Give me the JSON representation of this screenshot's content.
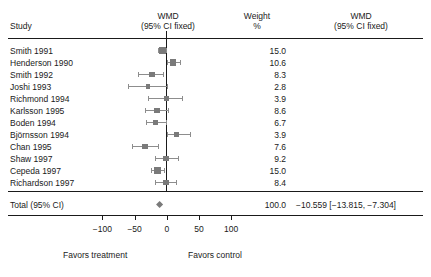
{
  "headers": {
    "study": "Study",
    "wmd_left_line1": "WMD",
    "wmd_left_line2": "(95% CI fixed)",
    "weight_line1": "Weight",
    "weight_line2": "%",
    "wmd_right_line1": "WMD",
    "wmd_right_line2": "(95% CI fixed)"
  },
  "total": {
    "label": "Total (95% CI)",
    "weight": "100.0",
    "estimate": "−10.559 [−13.815, −7.304]"
  },
  "axis": {
    "tick_labels": [
      "−100",
      "−50",
      "0",
      "50",
      "100"
    ],
    "tick_values": [
      -100,
      -50,
      0,
      50,
      100
    ],
    "favors_left": "Favors treatment",
    "favors_right": "Favors control"
  },
  "colors": {
    "ink": "#1a1a1a",
    "marker": "#7a7a7a",
    "ci": "#8d8d8d",
    "background": "#ffffff"
  },
  "chart_data": {
    "type": "forest",
    "title": "WMD (95% CI fixed)",
    "xlabel": "",
    "ylabel": "",
    "xlim": [
      -130,
      50
    ],
    "grid": false,
    "effect_measure": "WMD",
    "model": "fixed",
    "null_value": 0,
    "categories": [
      "Smith 1991",
      "Henderson 1990",
      "Smith 1992",
      "Joshi 1993",
      "Richmond 1994",
      "Karlsson 1995",
      "Boden 1994",
      "Björnsson 1994",
      "Chan 1995",
      "Shaw 1997",
      "Cepeda 1997",
      "Richardson 1997"
    ],
    "weights": [
      15.0,
      10.6,
      8.3,
      2.8,
      3.9,
      8.6,
      6.7,
      3.9,
      7.6,
      9.2,
      15.0,
      8.4
    ],
    "studies": [
      {
        "study": "Smith 1991",
        "weight": "15.0",
        "estimate": -7.0,
        "ci_low": -13.0,
        "ci_high": -1.5
      },
      {
        "study": "Henderson 1990",
        "weight": "10.6",
        "estimate": 9.5,
        "ci_low": 0.0,
        "ci_high": 20.0
      },
      {
        "study": "Smith 1992",
        "weight": "8.3",
        "estimate": -23.0,
        "ci_low": -44.0,
        "ci_high": -6.0
      },
      {
        "study": "Joshi 1993",
        "weight": "2.8",
        "estimate": -29.0,
        "ci_low": -60.0,
        "ci_high": 0.0
      },
      {
        "study": "Richmond 1994",
        "weight": "3.9",
        "estimate": 0.0,
        "ci_low": -29.0,
        "ci_high": 23.0
      },
      {
        "study": "Karlsson 1995",
        "weight": "8.6",
        "estimate": -15.5,
        "ci_low": -34.0,
        "ci_high": 1.5
      },
      {
        "study": "Boden 1994",
        "weight": "6.7",
        "estimate": -18.0,
        "ci_low": -32.0,
        "ci_high": -1.5
      },
      {
        "study": "Björnsson 1994",
        "weight": "3.9",
        "estimate": 15.5,
        "ci_low": 0.0,
        "ci_high": 36.0
      },
      {
        "study": "Chan 1995",
        "weight": "7.6",
        "estimate": -34.0,
        "ci_low": -54.0,
        "ci_high": -14.0
      },
      {
        "study": "Shaw 1997",
        "weight": "9.2",
        "estimate": -1.5,
        "ci_low": -18.0,
        "ci_high": 17.0
      },
      {
        "study": "Cepeda 1997",
        "weight": "15.0",
        "estimate": -14.0,
        "ci_low": -24.0,
        "ci_high": -4.0
      },
      {
        "study": "Richardson 1997",
        "weight": "8.4",
        "estimate": -1.5,
        "ci_low": -18.0,
        "ci_high": 14.0
      }
    ],
    "summary": {
      "label": "Total (95% CI)",
      "weight": "100.0",
      "estimate": -10.559,
      "ci_low": -13.815,
      "ci_high": -7.304,
      "estimate_text": "−10.559 [−13.815, −7.304]"
    }
  }
}
